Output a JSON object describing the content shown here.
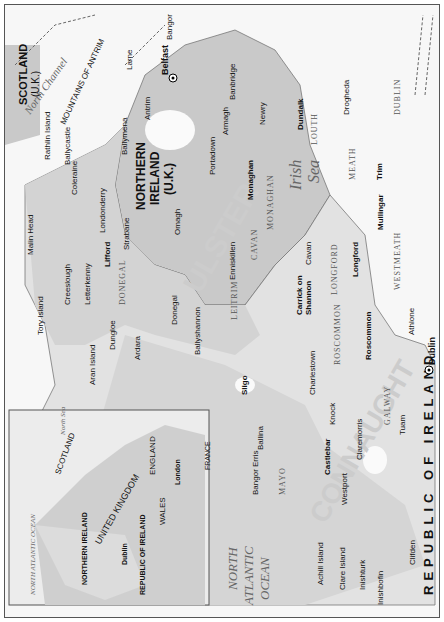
{
  "map": {
    "orientation": "rotated 90° counter-clockwise (north to the left)",
    "countries": [
      {
        "name": "NORTHERN IRELAND",
        "sub": "(U.K.)"
      },
      {
        "name": "REPUBLIC OF IRELAND"
      },
      {
        "name": "SCOTLAND",
        "sub": "(U.K.)"
      }
    ],
    "provinces": [
      "ULSTER",
      "CONNAUGHT"
    ],
    "seas": [
      {
        "name": "Irish",
        "name2": "Sea"
      },
      {
        "name": "NORTH",
        "name2": "ATLANTIC",
        "name3": "OCEAN"
      },
      {
        "name": "North Channel"
      }
    ],
    "ferry_routes": [
      "To Campbeltown",
      "To Cairnryan & Stranraer",
      "To Stranraer",
      "To Liverpool",
      "To Holyhead"
    ],
    "counties": [
      "DONEGAL",
      "LEITRIM",
      "SLIGO",
      "MAYO",
      "ROSCOMMON",
      "CAVAN",
      "MONAGHAN",
      "LONGFORD",
      "WESTMEATH",
      "MEATH",
      "LOUTH",
      "DUBLIN",
      "GALWAY"
    ],
    "mountains": [
      "MOUNTAINS OF ANTRIM",
      "SPERRIN MTS.",
      "MOURNE MTS.",
      "DERRYVEAGH MTS.",
      "BLUE STACK MTS.",
      "THE OX MTS."
    ],
    "parks": [
      "CONNEMARA NAT'L PARK"
    ],
    "water": [
      "Belfast Lough",
      "Strangford Lough",
      "Lough Neagh",
      "Lough Foyle",
      "Upper Lough Erne",
      "Lower Lough Erne",
      "Lough Allen",
      "Lough Sheelin",
      "Lough Ree",
      "Lough Conn",
      "Lough Mask",
      "Lough Corrib",
      "Dundalk Bay",
      "Donegal Bay",
      "Bann",
      "Finn",
      "Erne",
      "Boyne",
      "Liffey",
      "Annalee"
    ],
    "capitals": [
      "Belfast",
      "Dublin"
    ],
    "towns_major": [
      "Dundalk",
      "Monaghan",
      "Lifford",
      "Carrick on Shannon",
      "Sligo",
      "Longford",
      "Mullingar",
      "Trim",
      "Roscommon",
      "Castlebar"
    ],
    "towns": [
      "Larne",
      "Bangor",
      "Antrim",
      "Ballymena",
      "Ballycastle",
      "Coleraine",
      "Londonderry",
      "Strabane",
      "Omagh",
      "Portadown",
      "Armagh",
      "Banbridge",
      "Newry",
      "Drogheda",
      "Enniskillen",
      "Cavan",
      "Athlone",
      "Letterkenny",
      "Creeslough",
      "Dungloe",
      "Ardara",
      "Donegal",
      "Ballyshannon",
      "Charlestown",
      "Knock",
      "Claremorris",
      "Tuam",
      "Ballina",
      "Bangor Erris",
      "Westport",
      "Clifden"
    ],
    "airports": [
      "Belfast City Airport",
      "Belfast Int'l Airport",
      "Dublin Int'l Airport",
      "Donegal Airport",
      "Sligo Airport",
      "Ireland West Airport Knock",
      "Galway Airport"
    ],
    "islands": [
      "Rathlin Island",
      "Tory Island",
      "Aran Island",
      "Achill Island",
      "Clare Island",
      "Inishturk",
      "Inishbofin"
    ],
    "points": [
      "Giant's Causeway",
      "Malin Head"
    ],
    "roads": [
      "A1",
      "A26",
      "A6",
      "A5",
      "A4",
      "N1",
      "N2",
      "N3",
      "N4",
      "N13",
      "N15",
      "N16",
      "N17",
      "N26",
      "N55",
      "N56",
      "N59",
      "N60"
    ]
  },
  "inset": {
    "labels": [
      "SCOTLAND",
      "UNITED KINGDOM",
      "ENGLAND",
      "WALES",
      "NORTHERN IRELAND",
      "REPUBLIC OF IRELAND",
      "FRANCE"
    ],
    "seas": [
      "North Sea",
      "NORTH ATLANTIC OCEAN"
    ],
    "cities": [
      "Dublin",
      "London"
    ],
    "scale": {
      "zero": "0",
      "mi": "100 mi",
      "km": "100 km"
    }
  }
}
